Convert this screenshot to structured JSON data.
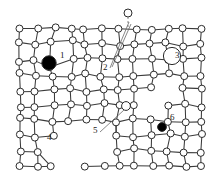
{
  "figure": {
    "kind": "crystal-lattice-defect-diagram",
    "background_color": "#ffffff",
    "line_color": "#3a3a3a",
    "atom_fill": "#ffffff",
    "atom_stroke": "#2b2b2b",
    "defect_fill": "#000000",
    "label_color": "#1a1a1a",
    "width": 216,
    "height": 180
  },
  "labels": [
    {
      "id": "1",
      "text": "1",
      "x": 60,
      "y": 58,
      "defect": "substitutional-large-atom"
    },
    {
      "id": "2",
      "text": "2",
      "x": 103,
      "y": 70,
      "defect": "external-adatom-arrow"
    },
    {
      "id": "3",
      "text": "3",
      "x": 175,
      "y": 58,
      "defect": "impurity-in-ring"
    },
    {
      "id": "4",
      "text": "4",
      "x": 47,
      "y": 140,
      "defect": "void-vacancy-cluster"
    },
    {
      "id": "5",
      "text": "5",
      "x": 93,
      "y": 133,
      "defect": "self-interstitial-arrow"
    },
    {
      "id": "6",
      "text": "6",
      "x": 170,
      "y": 120,
      "defect": "small-substitutional-atom"
    }
  ],
  "defect_markers": [
    {
      "name": "black-large-atom-1",
      "cx": 49,
      "cy": 63,
      "r": 7.2,
      "fill": "#000000"
    },
    {
      "name": "adatom-above-lattice-2",
      "cx": 128,
      "cy": 13,
      "r": 4.0,
      "fill": "#ffffff"
    },
    {
      "name": "ring-impurity-3",
      "cx": 172,
      "cy": 56,
      "r": 3.6,
      "fill": "#000000"
    },
    {
      "name": "ring-around-impurity-3",
      "cx": 172,
      "cy": 56,
      "r": 8.6,
      "fill": "#ffffff"
    },
    {
      "name": "interstitial-atom-5",
      "cx": 126,
      "cy": 106,
      "r": 4.4,
      "fill": "#ffffff"
    },
    {
      "name": "black-small-atom-6",
      "cx": 162,
      "cy": 127,
      "r": 4.4,
      "fill": "#000000"
    }
  ],
  "lattice": {
    "columns": 12,
    "rows": 10,
    "x_start": 20,
    "x_end": 201,
    "y_start": 29,
    "y_end": 166,
    "note": "distorted square lattice with vacancies and strain"
  }
}
